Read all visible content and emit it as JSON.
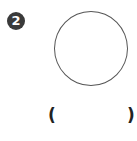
{
  "question": {
    "number": "2",
    "shape": "circle",
    "answer_open": "(",
    "answer_close": ")",
    "answer_value": ""
  },
  "colors": {
    "badge_bg": "#3a3a3a",
    "badge_text": "#ffffff",
    "outline": "#555555",
    "text": "#222222"
  }
}
